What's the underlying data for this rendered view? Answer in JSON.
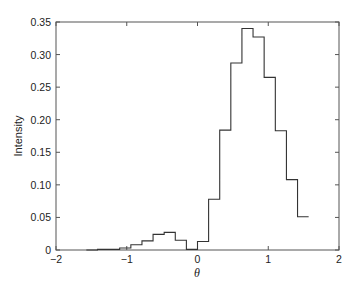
{
  "chart_data": {
    "type": "bar",
    "subtype": "step-histogram",
    "title": "",
    "xlabel": "θ",
    "ylabel": "Intensity",
    "xlim": [
      -2,
      2
    ],
    "ylim": [
      0,
      0.35
    ],
    "xticks": [
      -2,
      -1,
      0,
      1,
      2
    ],
    "xtick_labels": [
      "−2",
      "−1",
      "0",
      "1",
      "2"
    ],
    "yticks": [
      0,
      0.05,
      0.1,
      0.15,
      0.2,
      0.25,
      0.3,
      0.35
    ],
    "ytick_labels": [
      "0",
      "0.05",
      "0.10",
      "0.15",
      "0.20",
      "0.25",
      "0.30",
      "0.35"
    ],
    "grid": false,
    "legend": null,
    "bin_width": 0.157,
    "bin_edges": [
      -1.571,
      -1.414,
      -1.257,
      -1.1,
      -0.942,
      -0.785,
      -0.628,
      -0.471,
      -0.314,
      -0.157,
      0.0,
      0.157,
      0.314,
      0.471,
      0.628,
      0.785,
      0.942,
      1.1,
      1.257,
      1.414,
      1.571
    ],
    "values": [
      0.0,
      0.001,
      0.001,
      0.003,
      0.008,
      0.014,
      0.024,
      0.027,
      0.015,
      0.001,
      0.013,
      0.078,
      0.184,
      0.287,
      0.34,
      0.327,
      0.265,
      0.183,
      0.108,
      0.051
    ],
    "line_color": "#333333"
  }
}
